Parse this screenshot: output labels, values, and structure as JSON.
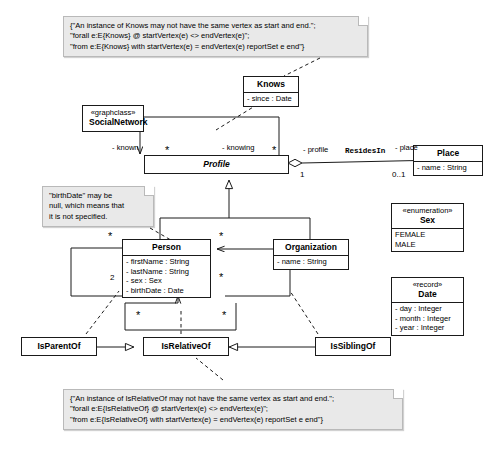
{
  "diagram": {
    "stroke_color": "#1a1a1a",
    "note_fill": "#e9e9e9",
    "box_fill": "#ffffff"
  },
  "notes": {
    "knows_constraint": {
      "name": "knows-constraint-note",
      "lines": [
        "{\"An instance of Knows may not have the same vertex as start and end.\";",
        "\"forall e:E{Knows} @ startVertex(e) <> endVertex(e)\";",
        "\"from e:E{Knows} with startVertex(e) = endVertex(e) reportSet e end\"}"
      ]
    },
    "birthdate_note": {
      "name": "birthdate-note",
      "lines": [
        "\"birthDate\" may be",
        "null, which means that",
        "it is not specified."
      ]
    },
    "isrelativeof_constraint": {
      "name": "isrelativeof-constraint-note",
      "lines": [
        "{\"An instance of IsRelativeOf may not have the same vertex as start and end.\";",
        "\"forall e:E{IsRelativeOf} @ startVertex(e) <> endVertex(e)\";",
        "\"from e:E{IsRelativeOf} with startVertex(e) = endVertex(e) reportSet e end\"}"
      ]
    }
  },
  "classes": {
    "social_network": {
      "stereotype": "«graphclass»",
      "name": "SocialNetwork",
      "attributes": []
    },
    "knows": {
      "stereotype": "",
      "name": "Knows",
      "attributes": [
        "- since : Date"
      ]
    },
    "profile": {
      "stereotype": "",
      "name": "Profile",
      "abstract": true,
      "attributes": []
    },
    "place": {
      "stereotype": "",
      "name": "Place",
      "attributes": [
        "- name : String"
      ]
    },
    "person": {
      "stereotype": "",
      "name": "Person",
      "attributes": [
        "- firstName : String",
        "- lastName : String",
        "- sex : Sex",
        "- birthDate : Date"
      ]
    },
    "organization": {
      "stereotype": "",
      "name": "Organization",
      "attributes": [
        "- name : String"
      ]
    },
    "sex": {
      "stereotype": "«enumeration»",
      "name": "Sex",
      "attributes": [
        "FEMALE",
        "MALE"
      ]
    },
    "date": {
      "stereotype": "«record»",
      "name": "Date",
      "attributes": [
        "- day : Integer",
        "- month : Integer",
        "- year : Integer"
      ]
    },
    "is_parent_of": {
      "stereotype": "",
      "name": "IsParentOf",
      "attributes": []
    },
    "is_relative_of": {
      "stereotype": "",
      "name": "IsRelativeOf",
      "attributes": []
    },
    "is_sibling_of": {
      "stereotype": "",
      "name": "IsSiblingOf",
      "attributes": []
    }
  },
  "edge_labels": {
    "known": "- known",
    "knowing": "- knowing",
    "profile_role": "- profile",
    "resides_in": "ResidesIn",
    "place_role": "- place",
    "star": "*",
    "one": "1",
    "zero_one": "0..1",
    "two": "2"
  }
}
